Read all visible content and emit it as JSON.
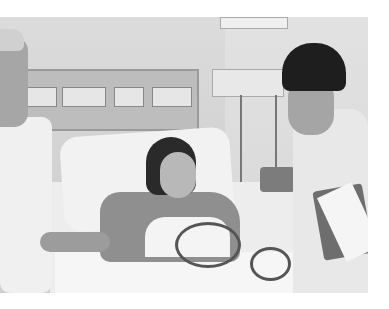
{
  "image": {
    "description": "Black-and-white photo of a hospital room: a patient lying in bed with tubes attached, a nurse in a cap at left touching her arm, and a nurse at right holding an open folder.",
    "colors": {
      "background": "#ffffff",
      "tone": "grayscale"
    }
  }
}
